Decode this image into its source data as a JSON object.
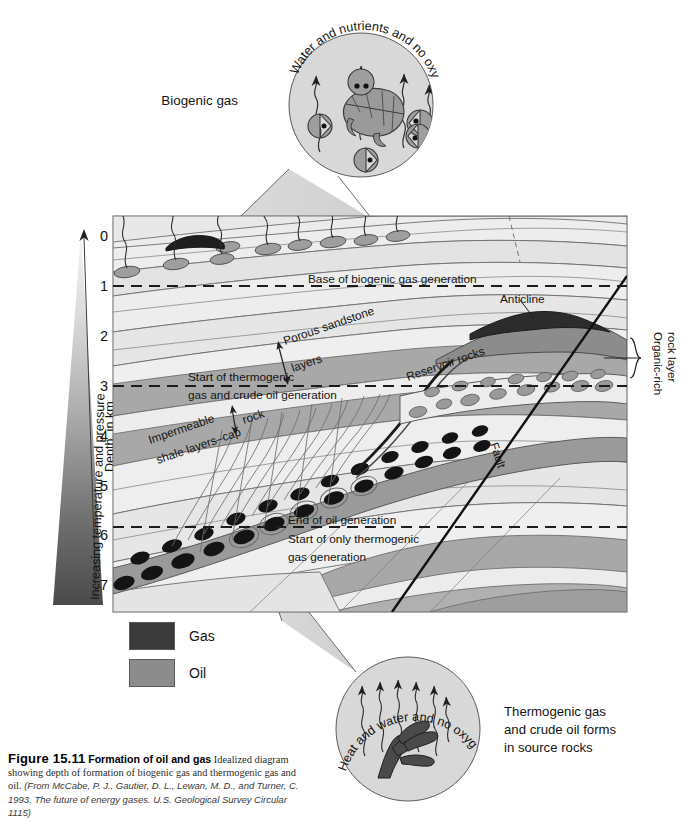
{
  "figure": {
    "number": "Figure 15.11",
    "title": "Formation of oil and gas",
    "lead": "Idealized",
    "body": "diagram showing depth of formation of biogenic gas and thermogenic gas and oil.",
    "source": "(From McCabe, P. J., Gautier, D. L., Lewan, M. D., and Turner, C. 1993. The future of energy gases. U.S. Geological Survey Circular 1115)"
  },
  "axis": {
    "title": "Depth, in km",
    "ticks": [
      "0",
      "1",
      "2",
      "3",
      "4",
      "5",
      "6",
      "7"
    ],
    "unit": "km",
    "min": 0,
    "max": 7
  },
  "gradient_wedge": {
    "label": "Increasing temperature and pressure",
    "top_color": "#f2f2f2",
    "bottom_color": "#4a4a4a"
  },
  "callouts": {
    "biogenic": {
      "label": "Biogenic gas",
      "rim_text": "Water and nutrients and no oxygen"
    },
    "thermogenic": {
      "rim_text": "Heat and water and no oxygen",
      "label_line1": "Thermogenic gas",
      "label_line2": "and crude oil forms",
      "label_line3": "in source rocks"
    }
  },
  "cross_section_labels": {
    "base_biogenic": "Base of biogenic gas generation",
    "porous_sandstone_l1": "Porous sandstone",
    "porous_sandstone_l2": "layers",
    "start_thermogenic_l1": "Start of thermogenic",
    "start_thermogenic_l2": "gas and crude oil generation",
    "impermeable_l1": "Impermeable",
    "impermeable_l2": "shale layers–cap",
    "impermeable_l3": "rock",
    "reservoir_rocks": "Reservoir rocks",
    "anticline": "Anticline",
    "fault": "Fault",
    "organic_rich_l1": "Organic-rich",
    "organic_rich_l2": "rock layer",
    "end_oil": "End of oil generation",
    "start_only_thermogenic_l1": "Start of only thermogenic",
    "start_only_thermogenic_l2": "gas generation"
  },
  "legend": {
    "items": [
      {
        "label": "Gas",
        "color": "#3a3a3a"
      },
      {
        "label": "Oil",
        "color": "#8c8c8c"
      }
    ]
  },
  "depth_markers": {
    "base_biogenic_km": 1,
    "start_thermogenic_km": 3,
    "end_oil_km": 5.8
  },
  "colors": {
    "gas": "#3a3a3a",
    "oil": "#8c8c8c",
    "shale": "#a8a8a8",
    "sandstone": "#ebebeb",
    "rock_light": "#e2e2e2",
    "stroke": "#5c5c5c"
  }
}
